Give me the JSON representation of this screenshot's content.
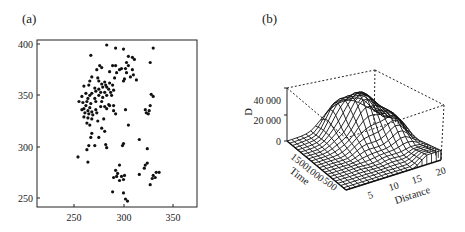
{
  "chart_data": [
    {
      "panel": "(a)",
      "type": "scatter",
      "title": "",
      "xlabel": "",
      "ylabel": "",
      "xlim": [
        213,
        375
      ],
      "ylim": [
        241,
        403
      ],
      "xticks": [
        250,
        300,
        350
      ],
      "yticks": [
        250,
        300,
        350,
        400
      ],
      "grid": false,
      "legend": null,
      "points": [
        [
          283,
          399
        ],
        [
          292,
          396
        ],
        [
          300,
          395
        ],
        [
          330,
          396
        ],
        [
          267,
          389
        ],
        [
          305,
          388
        ],
        [
          309,
          387
        ],
        [
          311,
          385
        ],
        [
          303,
          382
        ],
        [
          327,
          382
        ],
        [
          276,
          379
        ],
        [
          289,
          379
        ],
        [
          292,
          379
        ],
        [
          298,
          376
        ],
        [
          296,
          375
        ],
        [
          305,
          379
        ],
        [
          302,
          376
        ],
        [
          309,
          375
        ],
        [
          278,
          377
        ],
        [
          273,
          375
        ],
        [
          286,
          373
        ],
        [
          293,
          372
        ],
        [
          303,
          372
        ],
        [
          310,
          370
        ],
        [
          307,
          368
        ],
        [
          313,
          365
        ],
        [
          301,
          366
        ],
        [
          268,
          368
        ],
        [
          274,
          367
        ],
        [
          291,
          367
        ],
        [
          300,
          364
        ],
        [
          266,
          364
        ],
        [
          275,
          364
        ],
        [
          281,
          363
        ],
        [
          286,
          362
        ],
        [
          289,
          360
        ],
        [
          278,
          361
        ],
        [
          279,
          358
        ],
        [
          283,
          358
        ],
        [
          285,
          356
        ],
        [
          271,
          357
        ],
        [
          260,
          359
        ],
        [
          265,
          360
        ],
        [
          282,
          360
        ],
        [
          275,
          356
        ],
        [
          272,
          354
        ],
        [
          277,
          353
        ],
        [
          281,
          353
        ],
        [
          287,
          353
        ],
        [
          290,
          355
        ],
        [
          268,
          352
        ],
        [
          262,
          352
        ],
        [
          266,
          350
        ],
        [
          275,
          350
        ],
        [
          283,
          350
        ],
        [
          288,
          350
        ],
        [
          279,
          348
        ],
        [
          271,
          347
        ],
        [
          264,
          347
        ],
        [
          258,
          349
        ],
        [
          255,
          344
        ],
        [
          259,
          343
        ],
        [
          263,
          344
        ],
        [
          267,
          342
        ],
        [
          272,
          344
        ],
        [
          278,
          344
        ],
        [
          285,
          341
        ],
        [
          290,
          340
        ],
        [
          330,
          349
        ],
        [
          328,
          351
        ],
        [
          262,
          340
        ],
        [
          266,
          338
        ],
        [
          260,
          337
        ],
        [
          264,
          335
        ],
        [
          268,
          334
        ],
        [
          272,
          336
        ],
        [
          277,
          339
        ],
        [
          281,
          339
        ],
        [
          286,
          340
        ],
        [
          283,
          337
        ],
        [
          258,
          336
        ],
        [
          261,
          333
        ],
        [
          265,
          332
        ],
        [
          269,
          331
        ],
        [
          273,
          333
        ],
        [
          290,
          335
        ],
        [
          292,
          332
        ],
        [
          302,
          336
        ],
        [
          327,
          340
        ],
        [
          326,
          335
        ],
        [
          260,
          329
        ],
        [
          264,
          328
        ],
        [
          268,
          327
        ],
        [
          274,
          325
        ],
        [
          280,
          327
        ],
        [
          323,
          333
        ],
        [
          325,
          332
        ],
        [
          322,
          336
        ],
        [
          263,
          323
        ],
        [
          266,
          321
        ],
        [
          305,
          321
        ],
        [
          268,
          313
        ],
        [
          278,
          318
        ],
        [
          281,
          315
        ],
        [
          267,
          309
        ],
        [
          275,
          309
        ],
        [
          316,
          307
        ],
        [
          265,
          301
        ],
        [
          271,
          301
        ],
        [
          282,
          302
        ],
        [
          283,
          299
        ],
        [
          300,
          303
        ],
        [
          299,
          301
        ],
        [
          263,
          297
        ],
        [
          324,
          298
        ],
        [
          254,
          290
        ],
        [
          264,
          285
        ],
        [
          296,
          282
        ],
        [
          322,
          282
        ],
        [
          324,
          284
        ],
        [
          321,
          279
        ],
        [
          292,
          277
        ],
        [
          294,
          274
        ],
        [
          293,
          271
        ],
        [
          298,
          271
        ],
        [
          301,
          272
        ],
        [
          333,
          275
        ],
        [
          330,
          272
        ],
        [
          336,
          275
        ],
        [
          332,
          270
        ],
        [
          329,
          269
        ],
        [
          316,
          273
        ],
        [
          290,
          270
        ],
        [
          296,
          267
        ],
        [
          300,
          268
        ],
        [
          327,
          263
        ],
        [
          289,
          256
        ],
        [
          300,
          255
        ],
        [
          302,
          249
        ],
        [
          304,
          247
        ]
      ]
    },
    {
      "panel": "(b)",
      "type": "surface3d",
      "title": "",
      "xlabel": "Distance",
      "ylabel": "Time",
      "zlabel": "D",
      "x_ticks": [
        5,
        10,
        15,
        20
      ],
      "y_ticks": [
        500,
        1000,
        1500
      ],
      "z_ticks": [
        "0",
        "20 000",
        "40 000"
      ],
      "x_range": [
        0,
        20
      ],
      "y_range": [
        0,
        1800
      ],
      "z_range": [
        0,
        50000
      ],
      "grid": false,
      "legend": null,
      "description": "Wireframe surface; values near 0 at low Distance and across Time, rising to peaks ~40000-45000 around Distance 10-17 at high Time (1000-1800)."
    }
  ],
  "labels": {
    "panel_a": "(a)",
    "panel_b": "(b)",
    "a_x_ticks": [
      "250",
      "300",
      "350"
    ],
    "a_y_ticks": [
      "400",
      "350",
      "300",
      "250"
    ],
    "b_z_ticks": [
      "40 000",
      "20 000",
      "0"
    ],
    "b_time_ticks": [
      "1500",
      "1000",
      "500"
    ],
    "b_dist_ticks": [
      "5",
      "10",
      "15",
      "20"
    ],
    "b_zlabel": "D",
    "b_ylabel": "Time",
    "b_xlabel": "Distance"
  }
}
